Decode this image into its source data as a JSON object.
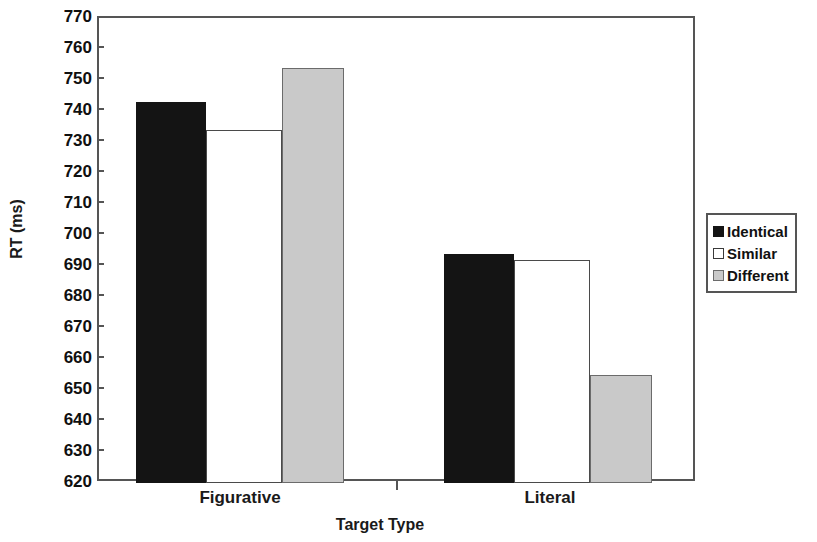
{
  "chart_data": {
    "type": "bar",
    "title": "",
    "xlabel": "Target Type",
    "ylabel": "RT (ms)",
    "categories": [
      "Figurative",
      "Literal"
    ],
    "series": [
      {
        "name": "Identical",
        "values": [
          743,
          694
        ],
        "color": "#141414"
      },
      {
        "name": "Similar",
        "values": [
          734,
          692
        ],
        "color": "#ffffff"
      },
      {
        "name": "Different",
        "values": [
          754,
          655
        ],
        "color": "#c9c9c9"
      }
    ],
    "ylim": [
      620,
      770
    ],
    "yticks": [
      620,
      630,
      640,
      650,
      660,
      670,
      680,
      690,
      700,
      710,
      720,
      730,
      740,
      750,
      760,
      770
    ],
    "grid": false,
    "legend_position": "right"
  },
  "axes": {
    "y_label": "RT (ms)",
    "x_label": "Target Type",
    "y_tick_labels": [
      "770",
      "760",
      "750",
      "740",
      "730",
      "720",
      "710",
      "700",
      "690",
      "680",
      "670",
      "660",
      "650",
      "640",
      "630",
      "620"
    ],
    "x_tick_labels": [
      "Figurative",
      "Literal"
    ]
  },
  "legend": {
    "items": [
      {
        "label": "Identical",
        "swatch": "identical"
      },
      {
        "label": "Similar",
        "swatch": "similar"
      },
      {
        "label": "Different",
        "swatch": "different"
      }
    ]
  },
  "colors": {
    "identical": "#141414",
    "similar": "#ffffff",
    "different": "#c9c9c9",
    "axis": "#555555",
    "text": "#111111"
  }
}
